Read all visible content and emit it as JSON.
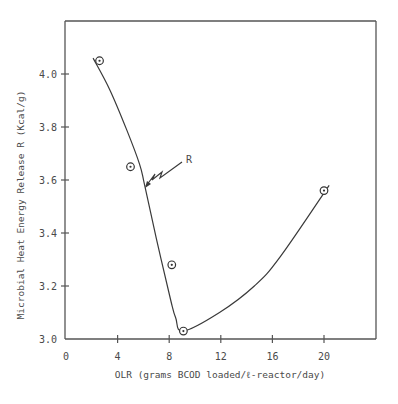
{
  "chart_data": {
    "type": "scatter",
    "title": "",
    "xlabel": "OLR (grams BCOD loaded/ℓ-reactor/day)",
    "ylabel": "Microbial Heat Energy Release R (Kcal/g)",
    "xlim": [
      0,
      24
    ],
    "ylim": [
      3.0,
      4.2
    ],
    "x_ticks": [
      0,
      4,
      8,
      12,
      16,
      20
    ],
    "x_tick_labels": [
      "0",
      "4",
      "8",
      "12",
      "16",
      "20"
    ],
    "y_ticks": [
      3.0,
      3.2,
      3.4,
      3.6,
      3.8,
      4.0
    ],
    "y_tick_labels": [
      "3.0",
      "3.2",
      "3.4",
      "3.6",
      "3.8",
      "4.0"
    ],
    "grid": false,
    "legend": null,
    "series": [
      {
        "name": "Observed",
        "marker": "circled-dot",
        "x": [
          2.6,
          5.0,
          8.2,
          9.1,
          20.0
        ],
        "y": [
          4.05,
          3.65,
          3.28,
          3.03,
          3.56
        ]
      },
      {
        "name": "Fitted curve R",
        "style": "line",
        "x": [
          2.1,
          3.4,
          4.7,
          5.7,
          6.1,
          7.0,
          8.1,
          8.5,
          9.1,
          11.9,
          14.6,
          16.6,
          20.4
        ],
        "y": [
          4.06,
          3.94,
          3.79,
          3.66,
          3.58,
          3.38,
          3.15,
          3.08,
          3.03,
          3.1,
          3.2,
          3.31,
          3.58
        ]
      }
    ],
    "annotations": [
      {
        "text": "R",
        "points_to": {
          "x": 6.1,
          "y": 3.58
        },
        "style": "zigzag-arrow"
      }
    ]
  }
}
